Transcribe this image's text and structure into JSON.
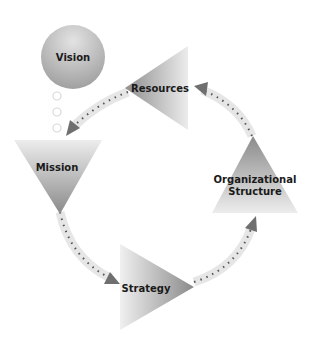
{
  "diagram": {
    "type": "cycle",
    "nodes": {
      "vision": {
        "label": "Vision",
        "shape": "circle"
      },
      "resources": {
        "label": "Resources",
        "shape": "triangle-left"
      },
      "mission": {
        "label": "Mission",
        "shape": "triangle-down"
      },
      "strategy": {
        "label": "Strategy",
        "shape": "triangle-right"
      },
      "org": {
        "label_line1": "Organizational",
        "label_line2": "Structure",
        "shape": "triangle-up"
      }
    },
    "connectors": [
      {
        "from": "Vision",
        "to": "Mission",
        "style": "dotted-circles"
      },
      {
        "from": "Resources",
        "to": "Mission",
        "style": "dashed-arrow"
      },
      {
        "from": "Mission",
        "to": "Strategy",
        "style": "dashed-arrow"
      },
      {
        "from": "Strategy",
        "to": "Organizational Structure",
        "style": "dashed-arrow"
      },
      {
        "from": "Organizational Structure",
        "to": "Resources",
        "style": "dashed-arrow"
      }
    ],
    "colors": {
      "shape_dark": "#8c8c8c",
      "shape_light": "#ececec",
      "arrow_band": "#e6e6e6",
      "arrow_head": "#6f6f6f",
      "dash": "#555555"
    }
  }
}
